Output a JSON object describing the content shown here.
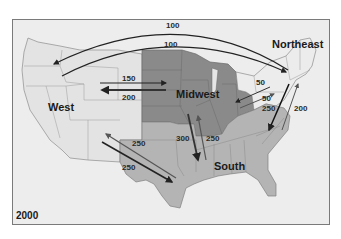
{
  "map": {
    "year": "2000",
    "regions": [
      {
        "name": "West",
        "color": "#e4e4e4"
      },
      {
        "name": "Midwest",
        "color": "#8a8a8a"
      },
      {
        "name": "Northeast",
        "color": "#e8e8e8"
      },
      {
        "name": "South",
        "color": "#b5b5b5"
      }
    ],
    "flows": [
      {
        "from": "Northeast",
        "to": "West",
        "value": "100"
      },
      {
        "from": "West",
        "to": "Northeast",
        "value": "100"
      },
      {
        "from": "West",
        "to": "Midwest",
        "value": "150"
      },
      {
        "from": "Midwest",
        "to": "West",
        "value": "200"
      },
      {
        "from": "Northeast",
        "to": "Midwest",
        "value": "50"
      },
      {
        "from": "Midwest",
        "to": "Northeast",
        "value": "50"
      },
      {
        "from": "Northeast",
        "to": "South",
        "value": "250"
      },
      {
        "from": "South",
        "to": "Northeast",
        "value": "200"
      },
      {
        "from": "Midwest",
        "to": "South",
        "value": "300"
      },
      {
        "from": "South",
        "to": "Midwest",
        "value": "250"
      },
      {
        "from": "South",
        "to": "West",
        "value": "250"
      },
      {
        "from": "West",
        "to": "South",
        "value": "250"
      }
    ]
  }
}
